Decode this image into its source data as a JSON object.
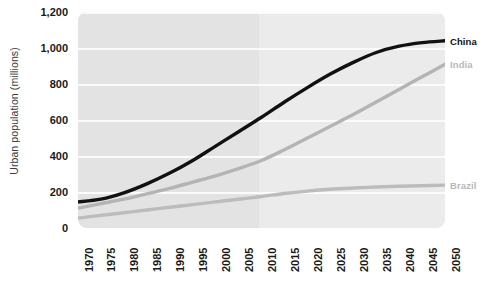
{
  "chart_data": {
    "type": "line",
    "title": "",
    "xlabel": "",
    "ylabel": "Urban population (millions)",
    "xlim": [
      1970,
      2050
    ],
    "ylim": [
      0,
      1200
    ],
    "grid": true,
    "legend_position": "right-inline",
    "x": [
      1970,
      1975,
      1980,
      1985,
      1990,
      1995,
      2000,
      2005,
      2010,
      2015,
      2020,
      2025,
      2030,
      2035,
      2040,
      2045,
      2050
    ],
    "xticklabels": [
      "1970",
      "1975",
      "1980",
      "1985",
      "1990",
      "1995",
      "2000",
      "2005",
      "2010",
      "2015",
      "2020",
      "2025",
      "2030",
      "2035",
      "2040",
      "2045",
      "2050"
    ],
    "yticks": [
      0,
      200,
      400,
      600,
      800,
      1000,
      1200
    ],
    "yticklabels": [
      "0",
      "200",
      "400",
      "600",
      "800",
      "1,000",
      "1,200"
    ],
    "projection_start_year": 2010,
    "series": [
      {
        "name": "China",
        "color": "#111111",
        "label_color": "#111111",
        "values": [
          145,
          160,
          195,
          245,
          305,
          375,
          455,
          535,
          615,
          700,
          780,
          855,
          920,
          975,
          1010,
          1030,
          1040
        ]
      },
      {
        "name": "India",
        "color": "#b4b4b4",
        "label_color": "#b8b8b8",
        "values": [
          110,
          135,
          160,
          190,
          220,
          255,
          290,
          330,
          375,
          435,
          500,
          565,
          630,
          700,
          770,
          840,
          910
        ]
      },
      {
        "name": "Brazil",
        "color": "#bcbcbc",
        "label_color": "#b8b8b8",
        "values": [
          55,
          70,
          85,
          100,
          115,
          130,
          145,
          160,
          175,
          192,
          205,
          215,
          222,
          228,
          232,
          235,
          238
        ]
      }
    ]
  },
  "colors": {
    "plot_past_bg": "#e3e3e3",
    "plot_future_bg": "#ebebeb",
    "gridline": "#fbfbfb",
    "tick_text": "#1a1a1a",
    "axis_label_text": "#3b3b3b",
    "page_bg": "#ffffff"
  }
}
